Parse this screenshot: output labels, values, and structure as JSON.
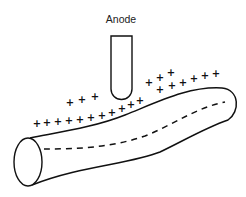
{
  "diagram": {
    "anode_label": "Anode",
    "charge_symbol": "+",
    "colors": {
      "stroke": "#111111",
      "background": "#ffffff",
      "label": "#222222"
    },
    "anode": {
      "shape": "test-tube electrode",
      "x": 111,
      "width": 21,
      "top": 36,
      "bottom": 100
    },
    "fiber": {
      "shape": "curved cylinder",
      "interior_line": "dashed"
    },
    "charges": {
      "lower_row": [
        [
          37,
          127
        ],
        [
          47,
          126
        ],
        [
          58,
          125
        ],
        [
          69,
          124
        ],
        [
          80,
          123
        ],
        [
          91,
          121
        ],
        [
          102,
          119
        ],
        [
          112,
          116
        ],
        [
          122,
          112
        ],
        [
          131,
          108
        ],
        [
          140,
          104
        ]
      ],
      "upper_left_row": [
        [
          70,
          106
        ],
        [
          82,
          103
        ],
        [
          95,
          100
        ]
      ],
      "upper_right_group": [
        [
          149,
          86
        ],
        [
          160,
          81
        ],
        [
          171,
          76
        ]
      ],
      "far_right_row": [
        [
          160,
          93
        ],
        [
          172,
          89
        ],
        [
          183,
          86
        ],
        [
          194,
          82
        ],
        [
          205,
          79
        ],
        [
          216,
          77
        ]
      ]
    }
  }
}
